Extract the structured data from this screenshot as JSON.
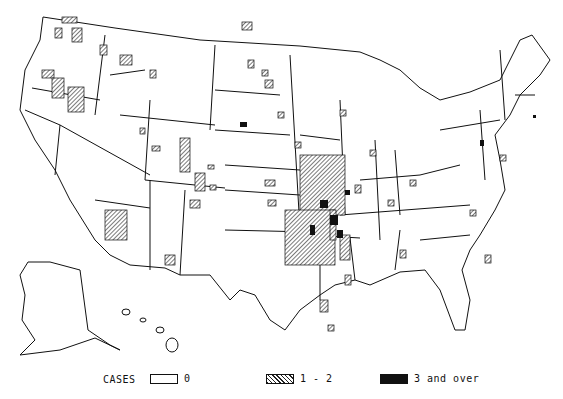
{
  "map": {
    "subject": "Counties reporting cases, contiguous United States, Alaska and Hawaii",
    "colors": {
      "outline": "#111111",
      "background": "#ffffff",
      "hatch": "#222222",
      "solid": "#111111"
    }
  },
  "legend": {
    "title": "CASES",
    "items": [
      {
        "label": "0",
        "style": "empty"
      },
      {
        "label": "1 - 2",
        "style": "hatched"
      },
      {
        "label": "3 and over",
        "style": "solid"
      }
    ]
  }
}
